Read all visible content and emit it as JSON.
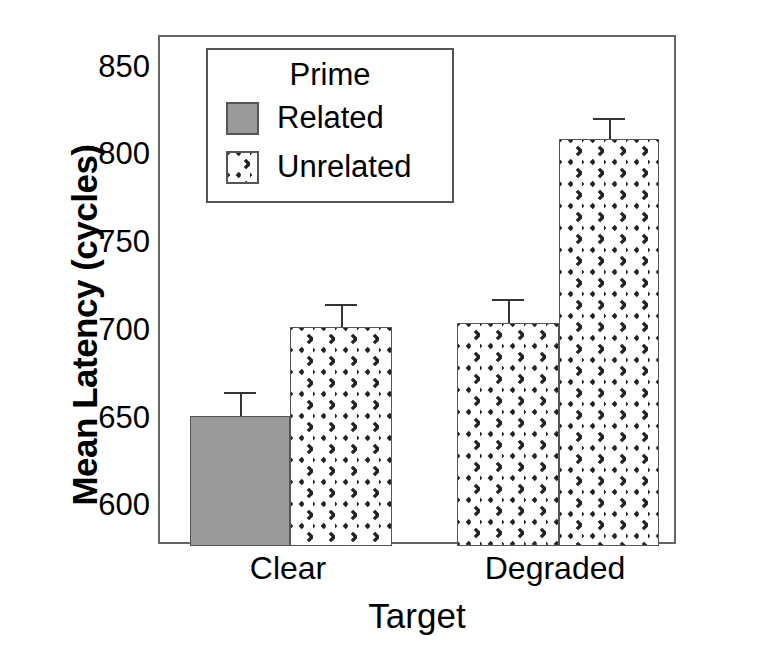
{
  "chart_data": {
    "type": "bar",
    "title": "",
    "xlabel": "Target",
    "ylabel": "Mean Latency (cycles)",
    "categories": [
      "Clear",
      "Degraded"
    ],
    "series": [
      {
        "name": "Related",
        "values": [
          652,
          null
        ],
        "errors": [
          14,
          null
        ],
        "fill": "solid"
      },
      {
        "name": "Unrelated",
        "values": [
          703,
          705
        ],
        "errors": [
          13,
          14
        ],
        "fill": "hatch"
      },
      {
        "name": "Unrelated",
        "values": [
          null,
          810
        ],
        "errors": [
          null,
          12
        ],
        "fill": "hatch"
      }
    ],
    "bars": [
      {
        "group": "Clear",
        "series": "Related",
        "value": 652,
        "err_low": 652,
        "err_high": 666,
        "fill": "solid"
      },
      {
        "group": "Clear",
        "series": "Unrelated",
        "value": 703,
        "err_low": 703,
        "err_high": 716,
        "fill": "hatch"
      },
      {
        "group": "Degraded",
        "series": "Unrelated",
        "value": 705,
        "err_low": 705,
        "err_high": 719,
        "fill": "hatch"
      },
      {
        "group": "Degraded",
        "series": "Unrelated",
        "value": 810,
        "err_low": 810,
        "err_high": 822,
        "fill": "hatch"
      }
    ],
    "ylim": [
      578,
      868
    ],
    "y_major_ticks": [
      600,
      650,
      700,
      750,
      800,
      850
    ],
    "y_minor_ticks": [
      625,
      675,
      725,
      775,
      825
    ],
    "grid": false,
    "legend_position": "top-left-inside"
  },
  "axes": {
    "y_tick_labels": [
      "850",
      "800",
      "750",
      "700",
      "650",
      "600"
    ],
    "x_tick_labels": [
      "Clear",
      "Degraded"
    ],
    "y_axis_title": "Mean Latency (cycles)",
    "x_axis_title": "Target"
  },
  "legend": {
    "title": "Prime",
    "entries": [
      {
        "label": "Related",
        "fill": "solid"
      },
      {
        "label": "Unrelated",
        "fill": "hatch"
      }
    ]
  },
  "colors": {
    "bar_solid_fill": "#9a9a9a",
    "bar_hatch_fill": "#ffffff",
    "hatch_stroke": "#222222",
    "axis_line": "#666666",
    "text": "#000000",
    "background": "#ffffff"
  }
}
